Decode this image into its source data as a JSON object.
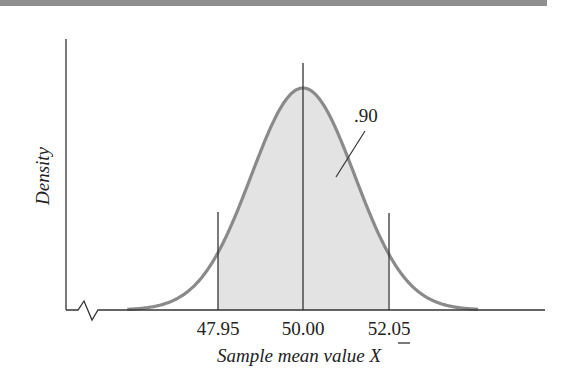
{
  "chart_data": {
    "type": "area",
    "title": "",
    "xlabel": "Sample mean value X̄",
    "xlabel_text": "Sample mean value ",
    "xlabel_symbol": "X",
    "ylabel": "Density",
    "x_ticks": [
      "47.95",
      "50.00",
      "52.05"
    ],
    "x_tick_values": [
      47.95,
      50.0,
      52.05
    ],
    "distribution": "normal",
    "mean": 50.0,
    "std_error": 1.2462,
    "shaded_interval": [
      47.95,
      52.05
    ],
    "shaded_area_label": ".90",
    "shaded_area": 0.9,
    "axis_break": true,
    "grid": false,
    "legend": null,
    "colors": {
      "curve": "#8a8a8a",
      "fill": "#e3e3e3",
      "axis": "#333333",
      "topbar": "#8f8f8f"
    }
  }
}
